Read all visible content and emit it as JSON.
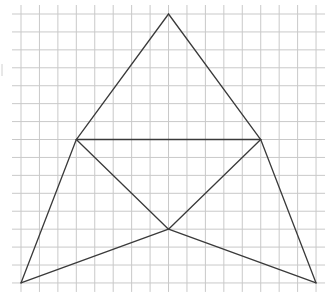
{
  "diagram": {
    "type": "geometry-grid-figure",
    "grid": {
      "columns": 16,
      "rows": 15,
      "origin_px": [
        21,
        14
      ],
      "cell_width_px": 18.44,
      "cell_height_px": 17.93,
      "line_color": "#c9c9c9",
      "overhang_px": 9
    },
    "stroke_color": "#3a3a3a",
    "vertices": {
      "A": {
        "label": "top",
        "col": 8,
        "row": 0
      },
      "B": {
        "label": "left-middle",
        "col": 3,
        "row": 7
      },
      "C": {
        "label": "right-middle",
        "col": 13,
        "row": 7
      },
      "D": {
        "label": "center",
        "col": 8,
        "row": 12
      },
      "E": {
        "label": "bottom-left",
        "col": 0,
        "row": 15
      },
      "F": {
        "label": "bottom-right",
        "col": 16,
        "row": 15
      }
    },
    "segments": [
      [
        "A",
        "B"
      ],
      [
        "A",
        "C"
      ],
      [
        "B",
        "C"
      ],
      [
        "B",
        "D"
      ],
      [
        "C",
        "D"
      ],
      [
        "B",
        "E"
      ],
      [
        "C",
        "F"
      ],
      [
        "E",
        "D"
      ],
      [
        "D",
        "F"
      ]
    ]
  }
}
